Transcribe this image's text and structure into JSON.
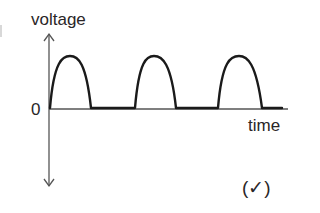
{
  "diagram": {
    "type": "half-wave rectified voltage-time graph",
    "y_axis_label": "voltage",
    "x_axis_label": "time",
    "origin_label": "0",
    "annotation": "(✓)",
    "waveform": {
      "description": "half-wave rectified sine",
      "pulses": 3,
      "pulse_peaks_x_px": [
        70,
        154,
        239
      ],
      "baseline": "zero between pulses"
    },
    "colors": {
      "background": "#ffffff",
      "axis": "#555555",
      "curve": "#1a1a1a",
      "text": "#2a2627"
    }
  }
}
